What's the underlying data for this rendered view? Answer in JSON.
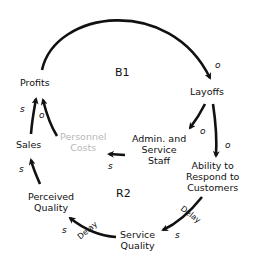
{
  "diagram": {
    "type": "causal-loop",
    "nodes": {
      "profits": "Profits",
      "layoffs": "Layoffs",
      "admin_staff": [
        "Admin. and",
        "Service",
        "Staff"
      ],
      "personnel_costs": [
        "Personnel",
        "Costs"
      ],
      "ability": [
        "Ability to",
        "Respond to",
        "Customers"
      ],
      "sales": "Sales",
      "perceived_quality": [
        "Perceived",
        "Quality"
      ],
      "service_quality": [
        "Service",
        "Quality"
      ]
    },
    "loops": {
      "b1": "B1",
      "r2": "R2"
    },
    "polarities": {
      "profits_layoffs": "o",
      "layoffs_admin": "o",
      "layoffs_ability": "o",
      "admin_costs": "s",
      "costs_profits": "o",
      "sales_profits": "s",
      "perceived_sales": "s",
      "service_perceived": "s",
      "ability_service": "s"
    },
    "delays": {
      "ability_service": "Delay",
      "service_perceived": "Delay"
    },
    "colors": {
      "line": "#111111",
      "ghost_text": "#b8b8b8"
    }
  }
}
